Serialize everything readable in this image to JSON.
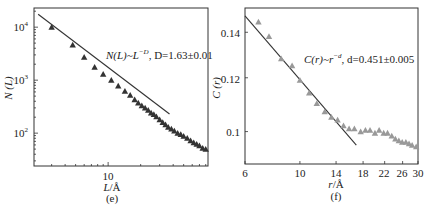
{
  "chart_data": [
    {
      "panel": "(e)",
      "type": "scatter",
      "xscale": "log",
      "yscale": "log",
      "xlabel": "L/Å",
      "ylabel": "N (L)",
      "xlim": [
        2.06,
        84
      ],
      "ylim": [
        24,
        23000
      ],
      "x_ticks": [
        10
      ],
      "x_tick_labels": [
        "10"
      ],
      "y_ticks": [
        100,
        1000,
        10000
      ],
      "y_tick_labels": [
        "10²",
        "10³",
        "10⁴"
      ],
      "annotation": "N(L)~L^−D, D=1.63±0.01",
      "fit_line": {
        "x": [
          2.25,
          37
        ],
        "y": [
          17500,
          230
        ],
        "slope": -1.63
      },
      "series": [
        {
          "name": "N(L)",
          "marker": "triangle",
          "color": "#333333",
          "x": [
            3.0,
            4.7,
            6.0,
            7.5,
            9.0,
            10.7,
            12.4,
            14.3,
            16.0,
            17.6,
            19.0,
            20.5,
            22.0,
            23.5,
            25.0,
            26.5,
            28.0,
            30.0,
            32.0,
            34.0,
            36.0,
            38.5,
            41.0,
            44.0,
            47.0,
            50.0,
            54.0,
            58.0,
            62.0,
            66.0,
            70.0,
            75.0,
            80.0
          ],
          "y": [
            10000,
            4600,
            2700,
            1750,
            1300,
            1000,
            780,
            620,
            520,
            430,
            370,
            330,
            300,
            270,
            240,
            225,
            205,
            180,
            160,
            145,
            130,
            120,
            110,
            100,
            95,
            88,
            80,
            72,
            66,
            62,
            58,
            52,
            50
          ]
        }
      ]
    },
    {
      "panel": "(f)",
      "type": "scatter",
      "xscale": "log",
      "yscale": "log",
      "xlabel": "r/Å",
      "ylabel": "C (r)",
      "xlim": [
        6,
        30
      ],
      "ylim": [
        0.0896,
        0.152
      ],
      "x_ticks": [
        6,
        10,
        14,
        18,
        22,
        26,
        30
      ],
      "x_tick_labels": [
        "6",
        "10",
        "14",
        "18",
        "22",
        "26",
        "30"
      ],
      "y_ticks": [
        0.1,
        0.12,
        0.14
      ],
      "y_tick_labels": [
        "0.1",
        "0.12",
        "0.14"
      ],
      "annotation": "C(r)~r^−d, d=0.451±0.005",
      "fit_line": {
        "x": [
          6.0,
          16.9
        ],
        "y": [
          0.148,
          0.0955
        ],
        "slope": -0.451
      },
      "series": [
        {
          "name": "C(r)",
          "marker": "triangle",
          "color": "#999999",
          "x": [
            6.8,
            7.5,
            8.4,
            9.3,
            10.0,
            10.9,
            11.7,
            12.6,
            13.4,
            14.2,
            15.0,
            15.8,
            16.6,
            17.6,
            18.4,
            19.2,
            20.1,
            20.9,
            21.8,
            22.6,
            23.5,
            24.3,
            25.1,
            25.9,
            26.8,
            27.6,
            28.4,
            29.5
          ],
          "y": [
            0.145,
            0.138,
            0.128,
            0.125,
            0.119,
            0.114,
            0.11,
            0.107,
            0.105,
            0.104,
            0.102,
            0.101,
            0.101,
            0.1,
            0.1005,
            0.1005,
            0.0995,
            0.1005,
            0.0995,
            0.0995,
            0.0985,
            0.0975,
            0.097,
            0.0965,
            0.0965,
            0.096,
            0.0955,
            0.095
          ]
        }
      ]
    }
  ],
  "labels": {
    "left_ylabel": "N (L)",
    "left_xlabel_var": "L",
    "left_xlabel_unit": "/Å",
    "left_panel": "(e)",
    "left_annot_a": "N(L)~L",
    "left_annot_sup": "−D",
    "left_annot_b": ", D=1.63±0.01",
    "right_ylabel": "C (r)",
    "right_xlabel_var": "r",
    "right_xlabel_unit": "/Å",
    "right_panel": "(f)",
    "right_annot_a": "C(r)~r",
    "right_annot_sup": "−d",
    "right_annot_b": ", d=0.451±0.005",
    "left_yticks": [
      "10",
      "10",
      "10"
    ],
    "left_yexp": [
      "4",
      "3",
      "2"
    ],
    "left_xtick": "10",
    "right_yticks": [
      "0.14",
      "0.12",
      "0.1"
    ],
    "right_xticks": [
      "6",
      "10",
      "14",
      "18",
      "22",
      "26",
      "30"
    ]
  }
}
